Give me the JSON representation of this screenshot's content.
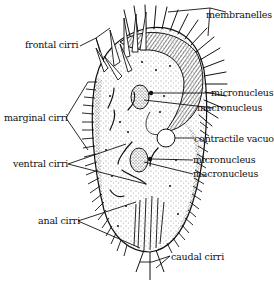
{
  "diagram": {
    "labels": {
      "membranelles": "membranelles",
      "frontal_cirri": "frontal cirri",
      "micronucleus_1": "micronucleus",
      "macronucleus_1": "macronucleus",
      "marginal_cirri": "marginal cirri",
      "contractile_vacuole": "contractile vacuole",
      "ventral_cirri": "ventral cirri",
      "micronucleus_2": "micronucleus",
      "macronucleus_2": "macronucleus",
      "anal_cirri": "anal cirri",
      "caudal_cirri": "caudal cirri"
    },
    "colors": {
      "ink": "#111111",
      "background": "#ffffff"
    }
  }
}
